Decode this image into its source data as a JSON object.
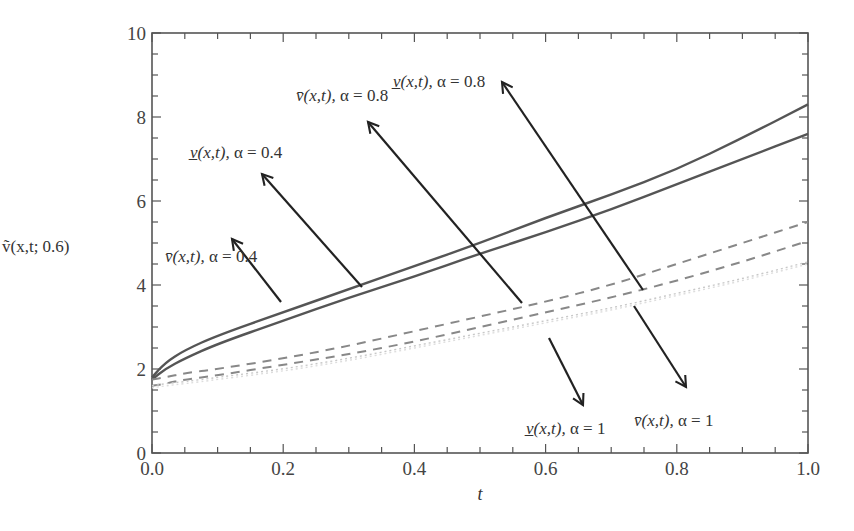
{
  "chart_data": {
    "type": "line",
    "title": "",
    "xlabel": "t",
    "ylabel": "ṽ(x,t; 0.6)",
    "xlim": [
      0.0,
      1.0
    ],
    "ylim": [
      0,
      10
    ],
    "grid": false,
    "legend": "none (arrow annotations)",
    "x_ticks": [
      "0.0",
      "0.2",
      "0.4",
      "0.6",
      "0.8",
      "1.0"
    ],
    "y_ticks": [
      "0",
      "2",
      "4",
      "6",
      "8",
      "10"
    ],
    "x": [
      0.0,
      0.02,
      0.05,
      0.1,
      0.2,
      0.3,
      0.4,
      0.5,
      0.6,
      0.7,
      0.8,
      0.9,
      1.0
    ],
    "series": [
      {
        "name": "v̲(x,t), α=0.4",
        "style": "solid",
        "color": "#555555",
        "values": [
          1.8,
          2.15,
          2.45,
          2.8,
          3.35,
          3.9,
          4.45,
          5.0,
          5.6,
          6.15,
          6.75,
          7.5,
          8.3
        ]
      },
      {
        "name": "v̄(x,t), α=0.4",
        "style": "solid",
        "color": "#555555",
        "values": [
          1.75,
          2.0,
          2.25,
          2.6,
          3.15,
          3.7,
          4.2,
          4.75,
          5.25,
          5.8,
          6.4,
          7.0,
          7.6
        ]
      },
      {
        "name": "v̲(x,t), α=0.8",
        "style": "dashed",
        "color": "#888888",
        "values": [
          1.75,
          1.8,
          1.9,
          2.0,
          2.25,
          2.55,
          2.9,
          3.25,
          3.6,
          4.0,
          4.5,
          5.0,
          5.5
        ]
      },
      {
        "name": "v̄(x,t), α=0.8",
        "style": "dashed",
        "color": "#888888",
        "values": [
          1.6,
          1.65,
          1.75,
          1.85,
          2.1,
          2.35,
          2.65,
          3.0,
          3.35,
          3.7,
          4.1,
          4.55,
          5.05
        ]
      },
      {
        "name": "v̲(x,t), α=1",
        "style": "dotted",
        "color": "#c8c8c8",
        "values": [
          1.6,
          1.65,
          1.7,
          1.8,
          2.0,
          2.25,
          2.55,
          2.85,
          3.15,
          3.45,
          3.8,
          4.15,
          4.55
        ]
      },
      {
        "name": "v̄(x,t), α=1",
        "style": "dotted",
        "color": "#dddddd",
        "values": [
          1.55,
          1.6,
          1.65,
          1.75,
          1.95,
          2.2,
          2.5,
          2.8,
          3.1,
          3.4,
          3.75,
          4.1,
          4.5
        ]
      }
    ],
    "annotations": [
      {
        "text_prefix": "v̄(x,t), ",
        "text_alpha": "α = 0.4",
        "direction": "up-left"
      },
      {
        "text_prefix": "v̲(x,t), ",
        "text_alpha": "α = 0.4",
        "direction": "up-left"
      },
      {
        "text_prefix": "v̄(x,t), ",
        "text_alpha": "α = 0.8",
        "direction": "up-left"
      },
      {
        "text_prefix": "v̲(x,t), ",
        "text_alpha": "α = 0.8",
        "direction": "up-left"
      },
      {
        "text_prefix": "v̲(x,t), ",
        "text_alpha": "α = 1",
        "direction": "down-right"
      },
      {
        "text_prefix": "v̄(x,t), ",
        "text_alpha": "α = 1",
        "direction": "down-right"
      }
    ]
  }
}
